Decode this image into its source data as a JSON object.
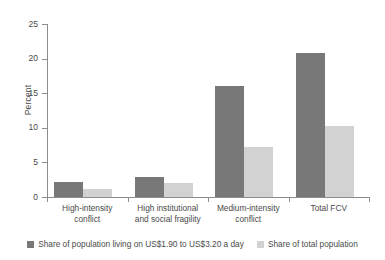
{
  "chart_data": {
    "type": "bar",
    "title": "",
    "xlabel": "",
    "ylabel": "Percent",
    "ylim": [
      0,
      25
    ],
    "yticks": [
      "0",
      "5",
      "10",
      "15",
      "20",
      "25"
    ],
    "grid": false,
    "legend_position": "bottom",
    "categories": [
      "High-intensity conflict",
      "High institutional and social fragility",
      "Medium-intensity conflict",
      "Total FCV"
    ],
    "category_lines": [
      [
        "High-intensity",
        "conflict"
      ],
      [
        "High institutional",
        "and social fragility"
      ],
      [
        "Medium-intensity",
        "conflict"
      ],
      [
        "Total FCV",
        ""
      ]
    ],
    "series": [
      {
        "name": "Share of population living on US$1.90 to US$3.20 a day",
        "color": "#787878",
        "values": [
          2.1,
          2.9,
          16.0,
          20.8
        ]
      },
      {
        "name": "Share of total population",
        "color": "#d2d2d2",
        "values": [
          1.1,
          2.0,
          7.2,
          10.2
        ]
      }
    ]
  },
  "axis": {
    "y_title": "Percent"
  }
}
